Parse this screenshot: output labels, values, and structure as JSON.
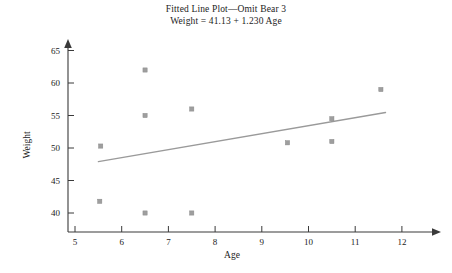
{
  "title": {
    "line1": "Fitted Line Plot—Omit Bear 3",
    "line2": "Weight = 41.13 + 1.230 Age"
  },
  "axes": {
    "x_title": "Age",
    "y_title": "Weight",
    "x_ticks": [
      "5",
      "6",
      "7",
      "8",
      "9",
      "10",
      "11",
      "12"
    ],
    "y_ticks": [
      "40",
      "45",
      "50",
      "55",
      "60",
      "65"
    ]
  },
  "colors": {
    "point": "#9e9e9e",
    "line": "#9a9a9a",
    "axis": "#3a3a3a",
    "text": "#1c1c1c",
    "background": "#ffffff"
  },
  "chart_data": {
    "type": "scatter",
    "title": "Fitted Line Plot—Omit Bear 3",
    "subtitle": "Weight = 41.13 + 1.230 Age",
    "xlabel": "Age",
    "ylabel": "Weight",
    "xlim": [
      4.6,
      12.5
    ],
    "ylim": [
      38.0,
      66.5
    ],
    "xticks": [
      5,
      6,
      7,
      8,
      9,
      10,
      11,
      12
    ],
    "yticks": [
      40,
      45,
      50,
      55,
      60,
      65
    ],
    "grid": false,
    "legend": "none",
    "points": [
      {
        "x": 5.55,
        "y": 50.3
      },
      {
        "x": 5.53,
        "y": 41.8
      },
      {
        "x": 6.5,
        "y": 62.0
      },
      {
        "x": 6.5,
        "y": 55.0
      },
      {
        "x": 6.5,
        "y": 40.0
      },
      {
        "x": 7.5,
        "y": 56.0
      },
      {
        "x": 7.5,
        "y": 40.0
      },
      {
        "x": 9.55,
        "y": 50.8
      },
      {
        "x": 10.5,
        "y": 54.5
      },
      {
        "x": 10.5,
        "y": 51.0
      },
      {
        "x": 11.55,
        "y": 59.0
      }
    ],
    "fit_line": {
      "equation": "Weight = 41.13 + 1.230 Age",
      "intercept": 41.13,
      "slope": 1.23,
      "x_start": 5.5,
      "x_end": 11.65,
      "y_start": 47.9,
      "y_end": 55.46
    }
  }
}
